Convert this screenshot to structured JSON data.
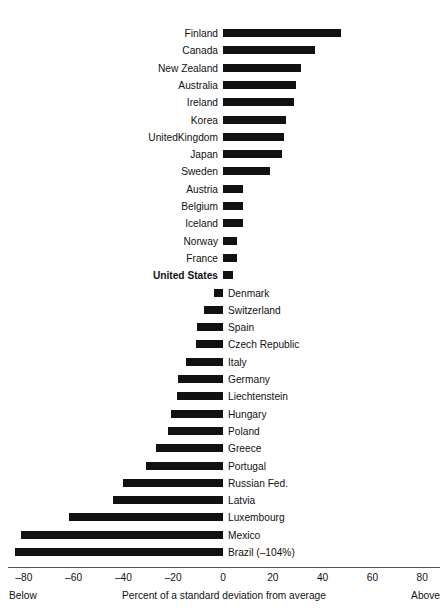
{
  "chart_data": {
    "type": "bar",
    "orientation": "horizontal",
    "title": "",
    "xlabel": "Percent of a standard deviation from average",
    "ylabel": "",
    "xlim": [
      -80,
      80
    ],
    "xticks": [
      "–80",
      "–60",
      "–40",
      "–20",
      "0",
      "20",
      "40",
      "60",
      "80"
    ],
    "xtick_values": [
      -80,
      -60,
      -40,
      -20,
      0,
      20,
      40,
      60,
      80
    ],
    "grid": false,
    "legend": false,
    "left_end_caption": "Below",
    "right_end_caption": "Above",
    "bar_color": "#111111",
    "axis_color": "#555555",
    "categories": [
      "Finland",
      "Canada",
      "New Zealand",
      "Australia",
      "Ireland",
      "Korea",
      "UnitedKingdom",
      "Japan",
      "Sweden",
      "Austria",
      "Belgium",
      "Iceland",
      "Norway",
      "France",
      "United States",
      "Denmark",
      "Switzerland",
      "Spain",
      "Czech Republic",
      "Italy",
      "Germany",
      "Liechtenstein",
      "Hungary",
      "Poland",
      "Greece",
      "Portugal",
      "Russian Fed.",
      "Latvia",
      "Luxembourg",
      "Mexico",
      "Brazil (–104%)"
    ],
    "values": [
      47.5,
      36.8,
      31.5,
      29.5,
      28.5,
      25.5,
      24.5,
      23.5,
      19.0,
      8.0,
      8.0,
      8.0,
      5.5,
      5.5,
      4.0,
      -3.5,
      -7.5,
      -10.5,
      -11.0,
      -15.0,
      -18.0,
      -18.5,
      -21.0,
      -22.0,
      -27.0,
      -31.0,
      -40.0,
      -44.0,
      -62.0,
      -81.0,
      -83.5
    ],
    "bars": [
      {
        "label": "Finland",
        "value": 47.5,
        "bold": false,
        "side": "right"
      },
      {
        "label": "Canada",
        "value": 36.8,
        "bold": false,
        "side": "right"
      },
      {
        "label": "New Zealand",
        "value": 31.5,
        "bold": false,
        "side": "right"
      },
      {
        "label": "Australia",
        "value": 29.5,
        "bold": false,
        "side": "right"
      },
      {
        "label": "Ireland",
        "value": 28.5,
        "bold": false,
        "side": "right"
      },
      {
        "label": "Korea",
        "value": 25.5,
        "bold": false,
        "side": "right"
      },
      {
        "label": "UnitedKingdom",
        "value": 24.5,
        "bold": false,
        "side": "right"
      },
      {
        "label": "Japan",
        "value": 23.5,
        "bold": false,
        "side": "right"
      },
      {
        "label": "Sweden",
        "value": 19.0,
        "bold": false,
        "side": "right"
      },
      {
        "label": "Austria",
        "value": 8.0,
        "bold": false,
        "side": "right"
      },
      {
        "label": "Belgium",
        "value": 8.0,
        "bold": false,
        "side": "right"
      },
      {
        "label": "Iceland",
        "value": 8.0,
        "bold": false,
        "side": "right"
      },
      {
        "label": "Norway",
        "value": 5.5,
        "bold": false,
        "side": "right"
      },
      {
        "label": "France",
        "value": 5.5,
        "bold": false,
        "side": "right"
      },
      {
        "label": "United States",
        "value": 4.0,
        "bold": true,
        "side": "right"
      },
      {
        "label": "Denmark",
        "value": -3.5,
        "bold": false,
        "side": "left"
      },
      {
        "label": "Switzerland",
        "value": -7.5,
        "bold": false,
        "side": "left"
      },
      {
        "label": "Spain",
        "value": -10.5,
        "bold": false,
        "side": "left"
      },
      {
        "label": "Czech Republic",
        "value": -11.0,
        "bold": false,
        "side": "left"
      },
      {
        "label": "Italy",
        "value": -15.0,
        "bold": false,
        "side": "left"
      },
      {
        "label": "Germany",
        "value": -18.0,
        "bold": false,
        "side": "left"
      },
      {
        "label": "Liechtenstein",
        "value": -18.5,
        "bold": false,
        "side": "left"
      },
      {
        "label": "Hungary",
        "value": -21.0,
        "bold": false,
        "side": "left"
      },
      {
        "label": "Poland",
        "value": -22.0,
        "bold": false,
        "side": "left"
      },
      {
        "label": "Greece",
        "value": -27.0,
        "bold": false,
        "side": "left"
      },
      {
        "label": "Portugal",
        "value": -31.0,
        "bold": false,
        "side": "left"
      },
      {
        "label": "Russian Fed.",
        "value": -40.0,
        "bold": false,
        "side": "left"
      },
      {
        "label": "Latvia",
        "value": -44.0,
        "bold": false,
        "side": "left"
      },
      {
        "label": "Luxembourg",
        "value": -62.0,
        "bold": false,
        "side": "left"
      },
      {
        "label": "Mexico",
        "value": -81.0,
        "bold": false,
        "side": "left"
      },
      {
        "label": "Brazil (–104%)",
        "value": -83.5,
        "bold": false,
        "side": "left"
      }
    ]
  },
  "layout": {
    "zero_x": 223,
    "px_per_unit": 2.49,
    "first_row_y": 24,
    "row_pitch": 17.3,
    "axis_y": 567,
    "axis_left": 8,
    "axis_right": 440,
    "tick_row_y": 572,
    "caption_row_y": 589
  }
}
